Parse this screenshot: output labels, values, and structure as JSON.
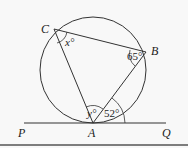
{
  "diagram": {
    "points": {
      "A": {
        "label": "A",
        "x": 93,
        "y": 123
      },
      "B": {
        "label": "B",
        "x": 146,
        "y": 52
      },
      "C": {
        "label": "C",
        "x": 54,
        "y": 29
      },
      "P": {
        "label": "P",
        "x": 24,
        "y": 123
      },
      "Q": {
        "label": "Q",
        "x": 166,
        "y": 123
      }
    },
    "circle": {
      "cx": 93,
      "cy": 70,
      "r": 53
    },
    "angles": {
      "x": "x°",
      "b": "65°",
      "y": "y°",
      "tangent": "52°"
    },
    "colors": {
      "stroke": "#333333",
      "text": "#222222",
      "border": "#555555"
    }
  }
}
